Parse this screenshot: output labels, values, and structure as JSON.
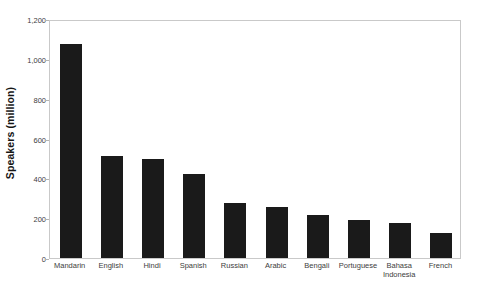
{
  "chart_data": {
    "type": "bar",
    "title": "",
    "subtitle": "",
    "xlabel": "",
    "ylabel": "Speakers (million)",
    "categories": [
      "Mandarin",
      "English",
      "Hindi",
      "Spanish",
      "Russian",
      "Arabic",
      "Bengali",
      "Portuguese",
      "Bahasa\nIndonesia",
      "French"
    ],
    "values": [
      1075,
      510,
      495,
      420,
      275,
      255,
      215,
      190,
      175,
      125
    ],
    "ylim": [
      0,
      1200
    ],
    "y_ticks": [
      0,
      200,
      400,
      600,
      800,
      1000,
      1200
    ],
    "y_tick_labels": [
      "0",
      "200",
      "400",
      "600",
      "800",
      "1,000",
      "1,200"
    ],
    "grid": false,
    "legend": false,
    "legend_position": "none",
    "bar_color": "#1a1a1a",
    "plot_border_color": "#c9c9c9",
    "background_color": "#ffffff",
    "axis_text_color": "#3d3d3d"
  }
}
